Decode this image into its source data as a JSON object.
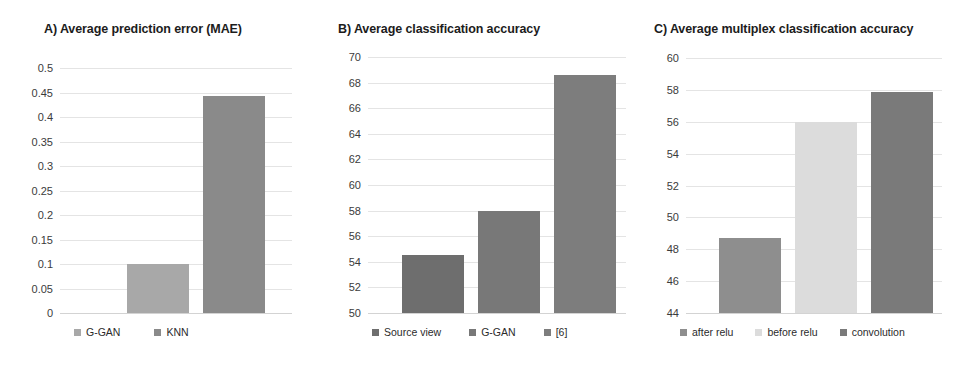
{
  "figure": {
    "background": "#ffffff",
    "panel_count": 3
  },
  "panels": {
    "a": {
      "title": "A) Average prediction error (MAE)",
      "legend": [
        {
          "label": "G-GAN",
          "color": "#a8a8a8"
        },
        {
          "label": "KNN",
          "color": "#8a8a8a"
        }
      ]
    },
    "b": {
      "title": "B) Average classification accuracy",
      "legend": [
        {
          "label": "Source view",
          "color": "#6e6e6e"
        },
        {
          "label": "G-GAN",
          "color": "#787878"
        },
        {
          "label": "[6]",
          "color": "#7d7d7d"
        }
      ]
    },
    "c": {
      "title": "C) Average multiplex classification accuracy",
      "legend": [
        {
          "label": "after relu",
          "color": "#8e8e8e"
        },
        {
          "label": "before relu",
          "color": "#dcdcdc"
        },
        {
          "label": "convolution",
          "color": "#7a7a7a"
        }
      ]
    }
  },
  "chart_data": [
    {
      "type": "bar",
      "panel": "A",
      "title": "A) Average prediction error (MAE)",
      "categories": [
        "G-GAN",
        "KNN"
      ],
      "values": [
        0.1,
        0.443
      ],
      "colors": [
        "#a8a8a8",
        "#8a8a8a"
      ],
      "xlabel": "",
      "ylabel": "",
      "ylim": [
        0,
        0.5
      ],
      "yticks": [
        0,
        0.05,
        0.1,
        0.15,
        0.2,
        0.25,
        0.3,
        0.35,
        0.4,
        0.45,
        0.5
      ],
      "ytick_labels": [
        "0",
        "0.05",
        "0.1",
        "0.15",
        "0.2",
        "0.25",
        "0.3",
        "0.35",
        "0.4",
        "0.45",
        "0.5"
      ],
      "grid": true,
      "legend_position": "bottom"
    },
    {
      "type": "bar",
      "panel": "B",
      "title": "B) Average classification accuracy",
      "categories": [
        "Source view",
        "G-GAN",
        "[6]"
      ],
      "values": [
        54.5,
        58.0,
        68.6
      ],
      "colors": [
        "#6e6e6e",
        "#787878",
        "#7d7d7d"
      ],
      "xlabel": "",
      "ylabel": "",
      "ylim": [
        50,
        70
      ],
      "yticks": [
        50,
        52,
        54,
        56,
        58,
        60,
        62,
        64,
        66,
        68,
        70
      ],
      "ytick_labels": [
        "50",
        "52",
        "54",
        "56",
        "58",
        "60",
        "62",
        "64",
        "66",
        "68",
        "70"
      ],
      "grid": true,
      "legend_position": "bottom"
    },
    {
      "type": "bar",
      "panel": "C",
      "title": "C) Average multiplex classification accuracy",
      "categories": [
        "after relu",
        "before relu",
        "convolution"
      ],
      "values": [
        48.7,
        56.0,
        57.85
      ],
      "colors": [
        "#8e8e8e",
        "#dcdcdc",
        "#7a7a7a"
      ],
      "xlabel": "",
      "ylabel": "",
      "ylim": [
        44,
        60
      ],
      "yticks": [
        44,
        46,
        48,
        50,
        52,
        54,
        56,
        58,
        60
      ],
      "ytick_labels": [
        "44",
        "46",
        "48",
        "50",
        "52",
        "54",
        "56",
        "58",
        "60"
      ],
      "grid": true,
      "legend_position": "bottom"
    }
  ]
}
